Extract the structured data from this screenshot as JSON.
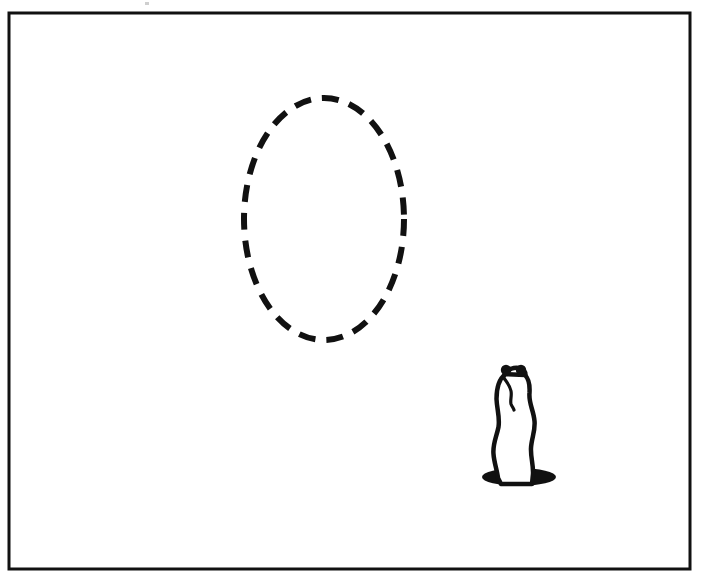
{
  "figure": {
    "kind": "line-drawing",
    "title": "Prairie dog beside dashed oval",
    "background_color": "#ffffff",
    "ink_color": "#111111"
  },
  "frame": {
    "name": "border-rectangle",
    "x": 9,
    "y": 13,
    "width": 681,
    "height": 556,
    "stroke_width": 3,
    "stroke_color": "#111111",
    "fill": "none"
  },
  "shapes": {
    "dashed_oval": {
      "name": "dashed-oval",
      "label": "Dashed oval outline",
      "cx": 324,
      "cy": 219,
      "rx": 80,
      "ry": 121,
      "stroke_color": "#111111",
      "stroke_width": 6,
      "dash_pattern": "17 11",
      "fill": "none"
    },
    "burrow_hole": {
      "name": "burrow-hole",
      "label": "Burrow hole",
      "cx": 519,
      "cy": 477,
      "rx": 37,
      "ry": 9,
      "fill_color": "#111111"
    },
    "animal": {
      "name": "prairie-dog",
      "label": "Prairie dog",
      "stroke_color": "#111111",
      "stroke_width": 4.5,
      "fill_color": "#ffffff",
      "bounds": {
        "x": 487,
        "y": 363,
        "width": 52,
        "height": 120
      },
      "body_path": "M 505.5 374 C 499 379 496.5 389 496.5 399 C 497 410 500 417 498.5 427 C 496.5 437 492.5 444 493.5 454 C 494 462 497 470 498 478 L 501 484 L 532 484 L 533 474 C 533.5 465 530.5 457 531 448 C 531.5 438 535.5 431 534.5 421 C 533.5 410 528.5 403 529.5 393 C 530 385 529 379 525 375 Z",
      "ear_left": {
        "cx": 506,
        "cy": 370,
        "r": 5.2
      },
      "ear_right": {
        "cx": 521,
        "cy": 370,
        "r": 5.2
      },
      "head_top_path": "M 505.5 374 C 508 369 514 367 519 368 C 523 369 525.5 371.5 525.5 375",
      "face_path": "M 504 378 C 508 384 510 386 511 391 C 512 396 510 400 511 404 C 512 407 513.5 408 514 410"
    }
  },
  "legend": {
    "items": [
      {
        "name": "dashed-oval",
        "label": "Dashed oval"
      },
      {
        "name": "prairie-dog",
        "label": "Prairie dog"
      },
      {
        "name": "burrow-hole",
        "label": "Burrow hole"
      }
    ]
  }
}
